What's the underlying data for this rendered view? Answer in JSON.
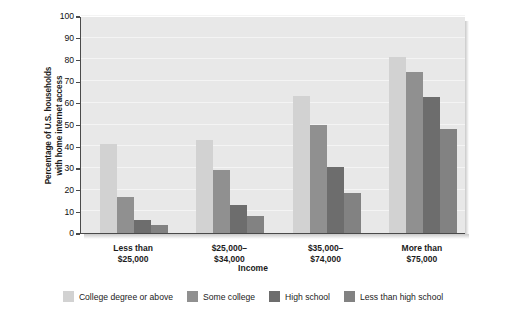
{
  "chart_data": {
    "type": "bar",
    "title": "",
    "subtitle": "",
    "xlabel": "Income",
    "ylabel": "Percentage of U.S. households with home internet access",
    "ylabel_line1": "Percentage of U.S. households",
    "ylabel_line2": "with home internet access",
    "categories": [
      "Less than $25,000",
      "$25,000–$34,000",
      "$35,000–$74,000",
      "More than $75,000"
    ],
    "category_lines": [
      [
        "Less than",
        "$25,000"
      ],
      [
        "$25,000–",
        "$34,000"
      ],
      [
        "$35,000–",
        "$74,000"
      ],
      [
        "More than",
        "$75,000"
      ]
    ],
    "series": [
      {
        "name": "College degree or above",
        "color": "#d2d2d2",
        "values": [
          41,
          43,
          63,
          81
        ]
      },
      {
        "name": "Some college",
        "color": "#909090",
        "values": [
          16.5,
          29,
          50,
          74
        ]
      },
      {
        "name": "High school",
        "color": "#6d6d6d",
        "values": [
          6,
          13,
          30.5,
          62.5
        ]
      },
      {
        "name": "Less than high school",
        "color": "#828282",
        "values": [
          3.5,
          8,
          18.5,
          48
        ]
      }
    ],
    "ylim": [
      0,
      100
    ],
    "ytick_values": [
      0,
      10,
      20,
      30,
      40,
      50,
      60,
      70,
      80,
      90,
      100
    ],
    "ytick_labels": [
      "0",
      "10",
      "20",
      "30",
      "40",
      "50",
      "60",
      "70",
      "80",
      "90",
      "100"
    ],
    "grid": true,
    "grid_axis": "y",
    "legend_position": "bottom",
    "plot_background": "#e8e8e8",
    "axis_color": "#4a4a4a",
    "gridline_color": "#f4f4f4",
    "text_color": "#1b1b1b"
  }
}
